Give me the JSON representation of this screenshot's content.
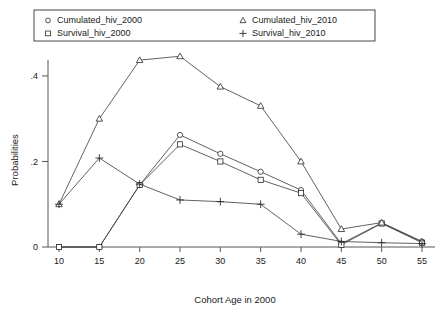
{
  "chart_data": {
    "type": "line",
    "title": "",
    "xlabel": "Cohort Age in 2000",
    "ylabel": "Probabilities",
    "x": [
      10,
      15,
      20,
      25,
      30,
      35,
      40,
      45,
      50,
      55
    ],
    "xticklabels": [
      "10",
      "15",
      "20",
      "25",
      "30",
      "35",
      "40",
      "45",
      "50",
      "55"
    ],
    "yticklabels": [
      "0",
      ".2",
      ".4"
    ],
    "ytickvalues": [
      0,
      0.2,
      0.4
    ],
    "xlim": [
      10,
      55
    ],
    "ylim": [
      0,
      0.47
    ],
    "grid": false,
    "legend_position": "top",
    "series": [
      {
        "name": "Cumulated_hiv_2000",
        "marker": "circle",
        "values": [
          0.0,
          0.0,
          0.145,
          0.262,
          0.218,
          0.176,
          0.133,
          0.008,
          0.056,
          0.012
        ]
      },
      {
        "name": "Survival_hiv_2000",
        "marker": "square",
        "values": [
          0.0,
          0.0,
          0.145,
          0.24,
          0.2,
          0.157,
          0.126,
          0.005,
          0.055,
          0.01
        ]
      },
      {
        "name": "Cumulated_hiv_2010",
        "marker": "triangle",
        "values": [
          0.1,
          0.3,
          0.437,
          0.446,
          0.375,
          0.33,
          0.2,
          0.042,
          0.057,
          0.013
        ]
      },
      {
        "name": "Survival_hiv_2010",
        "marker": "plus",
        "values": [
          0.1,
          0.208,
          0.147,
          0.11,
          0.106,
          0.1,
          0.03,
          0.013,
          0.01,
          0.008
        ]
      }
    ]
  },
  "legend": {
    "entries": [
      {
        "label": "Cumulated_hiv_2000",
        "marker": "circle"
      },
      {
        "label": "Cumulated_hiv_2010",
        "marker": "triangle"
      },
      {
        "label": "Survival_hiv_2000",
        "marker": "square"
      },
      {
        "label": "Survival_hiv_2010",
        "marker": "plus"
      }
    ]
  }
}
